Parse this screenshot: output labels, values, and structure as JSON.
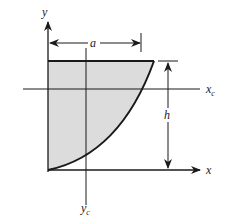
{
  "figure": {
    "type": "area-centroid-diagram",
    "shape": "spandrel region bounded by y-axis, top edge and concave curve",
    "fill_color": "#dcdcdc",
    "line_color": "#1a1a1a"
  },
  "labels": {
    "y_axis": "y",
    "x_axis": "x",
    "centroid_x_axis": "x",
    "centroid_x_sub": "c",
    "centroid_y_axis": "y",
    "centroid_y_sub": "c",
    "width_dimension": "a",
    "height_dimension": "h"
  }
}
